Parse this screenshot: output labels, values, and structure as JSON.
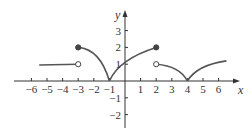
{
  "chart_data": {
    "type": "line",
    "title": "",
    "xlabel": "x",
    "ylabel": "y",
    "xlim": [
      -6.5,
      7
    ],
    "ylim": [
      -2.5,
      3.5
    ],
    "grid": false,
    "x_ticks": [
      "-6",
      "-5",
      "-4",
      "-3",
      "-2",
      "-1",
      "1",
      "2",
      "3",
      "4",
      "5",
      "6"
    ],
    "y_ticks": [
      "-2",
      "-1",
      "1",
      "2",
      "3"
    ],
    "segments": [
      {
        "name": "piece-1",
        "x": [
          -5.5,
          -3
        ],
        "y": [
          1.0,
          1.0
        ],
        "shape": "nearly horizontal, slight rise",
        "start": "none",
        "end": "open"
      },
      {
        "name": "piece-2",
        "x": [
          -3,
          -1
        ],
        "y": [
          2.0,
          0.0
        ],
        "shape": "concave-down arc falling to cusp",
        "start": "closed",
        "end": "cusp"
      },
      {
        "name": "piece-3",
        "x": [
          -1,
          2
        ],
        "y": [
          0.0,
          2.0
        ],
        "shape": "concave-down arc rising",
        "start": "cusp",
        "end": "closed"
      },
      {
        "name": "piece-4",
        "x": [
          2,
          4
        ],
        "y": [
          1.0,
          0.0
        ],
        "shape": "concave-down arc falling to cusp",
        "start": "open",
        "end": "cusp"
      },
      {
        "name": "piece-5",
        "x": [
          4,
          6.5
        ],
        "y": [
          0.0,
          1.0
        ],
        "shape": "concave-down arc rising",
        "start": "cusp",
        "end": "none"
      }
    ],
    "points": [
      {
        "x": -3,
        "y": 1,
        "type": "open"
      },
      {
        "x": -3,
        "y": 2,
        "type": "closed"
      },
      {
        "x": 2,
        "y": 2,
        "type": "closed"
      },
      {
        "x": 2,
        "y": 1,
        "type": "open"
      }
    ]
  },
  "labels": {
    "x_axis": "x",
    "y_axis": "y",
    "x_ticks": [
      {
        "v": -6,
        "t": "−6"
      },
      {
        "v": -5,
        "t": "−5"
      },
      {
        "v": -4,
        "t": "−4"
      },
      {
        "v": -3,
        "t": "−3"
      },
      {
        "v": -2,
        "t": "−2"
      },
      {
        "v": -1,
        "t": "−1"
      },
      {
        "v": 1,
        "t": "1"
      },
      {
        "v": 2,
        "t": "2"
      },
      {
        "v": 3,
        "t": "3"
      },
      {
        "v": 4,
        "t": "4"
      },
      {
        "v": 5,
        "t": "5"
      },
      {
        "v": 6,
        "t": "6"
      }
    ],
    "y_ticks": [
      {
        "v": 3,
        "t": "3"
      },
      {
        "v": 2,
        "t": "2"
      },
      {
        "v": 1,
        "t": "1"
      },
      {
        "v": -1,
        "t": "−1"
      },
      {
        "v": -2,
        "t": "−2"
      }
    ]
  },
  "colors": {
    "curve": "#555555",
    "axis": "#333333",
    "dot": "#444444"
  }
}
